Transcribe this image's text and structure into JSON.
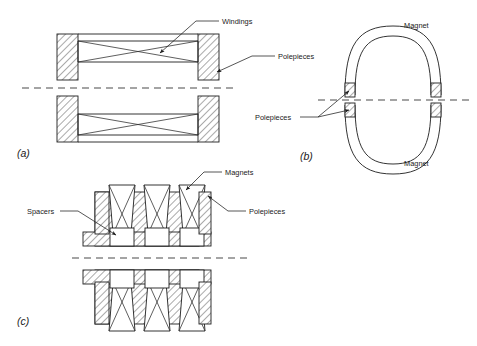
{
  "figure": {
    "title": "",
    "background_color": "#ffffff",
    "line_color": "#1d1d1d",
    "axis_color": "#4a4a4a",
    "panels": [
      {
        "id": "a",
        "caption": "(a)",
        "description": "Longitudinal section of a coil-wound electromagnet showing windings between polepieces, mirrored about the horizontal centre line.",
        "labels": [
          {
            "text": "Windings",
            "target": "winding-crossing"
          },
          {
            "text": "Polepieces",
            "target": "right-polepiece"
          }
        ]
      },
      {
        "id": "b",
        "caption": "(b)",
        "description": "Oval permanent-magnet yoke split about the centre line with hatched polepieces at the four gap faces.",
        "labels": [
          {
            "text": "Magnet",
            "target": "upper-yoke"
          },
          {
            "text": "Polepieces",
            "target": "gap-faces"
          },
          {
            "text": "Magnet",
            "target": "lower-yoke"
          }
        ]
      },
      {
        "id": "c",
        "caption": "(c)",
        "description": "Multi-pole stack of three magnets interleaved with hatched polepieces and spacers, mirrored about the centre line.",
        "labels": [
          {
            "text": "Magnets",
            "target": "top-magnet"
          },
          {
            "text": "Spacers",
            "target": "spacer-block"
          },
          {
            "text": "Polepieces",
            "target": "right-polepiece-stack"
          }
        ]
      }
    ],
    "text": {
      "windings": "Windings",
      "polepieces": "Polepieces",
      "magnet_top": "Magnet",
      "magnet_bottom": "Magnet",
      "polepieces_b": "Polepieces",
      "magnets": "Magnets",
      "spacers": "Spacers",
      "polepieces_c": "Polepieces",
      "cap_a": "(a)",
      "cap_b": "(b)",
      "cap_c": "(c)"
    }
  }
}
